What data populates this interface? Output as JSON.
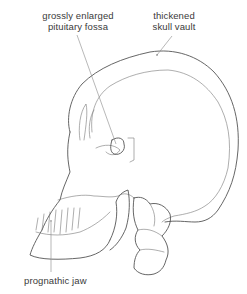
{
  "diagram": {
    "labels": {
      "fossa_line1": "grossly enlarged",
      "fossa_line2": "pituitary fossa",
      "vault_line1": "thickened",
      "vault_line2": "skull vault",
      "jaw": "prognathic jaw"
    },
    "colors": {
      "line": "#555555",
      "text": "#3a3a3a",
      "background": "#ffffff"
    }
  }
}
